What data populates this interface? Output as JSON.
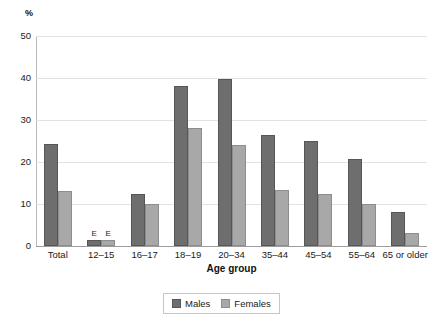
{
  "chart_data": {
    "type": "bar",
    "title": "",
    "subtitle": "",
    "xlabel": "Age group",
    "ylabel": "%",
    "ylim": [
      0,
      50
    ],
    "yticks": [
      0,
      10,
      20,
      30,
      40,
      50
    ],
    "grid": true,
    "legend_position": "bottom",
    "categories": [
      "Total",
      "12–15",
      "16–17",
      "18–19",
      "20–34",
      "35–44",
      "45–54",
      "55–64",
      "65 or older"
    ],
    "series": [
      {
        "name": "Males",
        "color": "#6e6e6e",
        "values": [
          24.3,
          1.5,
          12.3,
          38.1,
          39.7,
          26.4,
          25.1,
          20.8,
          8.0
        ]
      },
      {
        "name": "Females",
        "color": "#a8a8a8",
        "values": [
          13.2,
          1.5,
          10.0,
          28.0,
          24.1,
          13.4,
          12.3,
          10.1,
          3.0
        ]
      }
    ],
    "annotations": [
      {
        "label": "E",
        "category": "12–15",
        "series": "Males"
      },
      {
        "label": "E",
        "category": "12–15",
        "series": "Females"
      }
    ]
  },
  "axes": {
    "y_unit_label": "%",
    "y_tick_labels": [
      "50",
      "40",
      "30",
      "20",
      "10",
      "0"
    ],
    "x_axis_title": "Age group"
  },
  "legend": {
    "items": [
      {
        "label": "Males",
        "swatch": "males-swatch"
      },
      {
        "label": "Females",
        "swatch": "females-swatch"
      }
    ]
  }
}
